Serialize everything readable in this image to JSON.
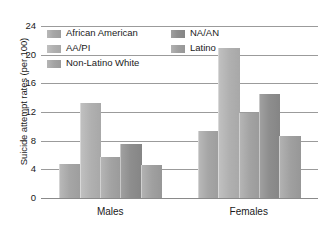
{
  "chart_data": {
    "type": "bar",
    "title": "",
    "subtitle": "",
    "xlabel": "",
    "ylabel": "Suicide attempt rates (per 100)",
    "categories": [
      "Males",
      "Females"
    ],
    "series": [
      {
        "name": "African American",
        "values": [
          4.7,
          9.3
        ],
        "color": "#a6a6a6"
      },
      {
        "name": "AA/PI",
        "values": [
          13.2,
          21.0
        ],
        "color": "#b0b0b0"
      },
      {
        "name": "Non-Latino White",
        "values": [
          5.7,
          11.8
        ],
        "color": "#a3a3a3"
      },
      {
        "name": "NA/AN",
        "values": [
          7.5,
          14.5
        ],
        "color": "#8e8e8e"
      },
      {
        "name": "Latino",
        "values": [
          4.6,
          8.7
        ],
        "color": "#a0a0a0"
      }
    ],
    "legend_order": [
      "African American",
      "AA/PI",
      "Non-Latino White",
      "NA/AN",
      "Latino"
    ],
    "legend_position": "top",
    "ylim": [
      0,
      24
    ],
    "yticks": [
      0,
      4,
      8,
      12,
      16,
      20,
      24
    ],
    "ytick_labels": [
      "0",
      "4",
      "8",
      "12",
      "16",
      "20",
      "24"
    ],
    "grid": true,
    "grid_axis": "y"
  },
  "legend": {
    "left_column": [
      {
        "label": "African American",
        "series_index": 0
      },
      {
        "label": "AA/PI",
        "series_index": 1
      },
      {
        "label": "Non-Latino White",
        "series_index": 2
      }
    ],
    "right_column": [
      {
        "label": "NA/AN",
        "series_index": 3
      },
      {
        "label": "Latino",
        "series_index": 4
      }
    ]
  }
}
